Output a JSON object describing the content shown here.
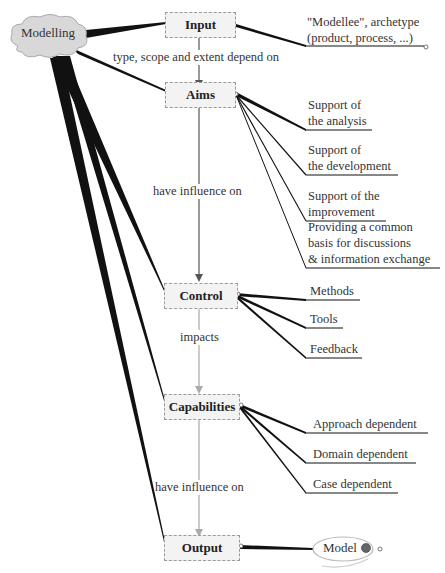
{
  "root": {
    "label": "Modelling",
    "shape": "cloud"
  },
  "nodes": [
    {
      "id": "input",
      "label": "Input"
    },
    {
      "id": "aims",
      "label": "Aims"
    },
    {
      "id": "control",
      "label": "Control"
    },
    {
      "id": "capabilities",
      "label": "Capabilities"
    },
    {
      "id": "output",
      "label": "Output"
    }
  ],
  "relations": {
    "input_to_aims": "type, scope and extent depend on",
    "aims_to_control": "have influence on",
    "control_to_capabilities": "impacts",
    "capabilities_to_output": "have influence on"
  },
  "input_leaves": [
    {
      "line1": "\"Modellee\", archetype",
      "line2": "(product, process, ...)"
    }
  ],
  "aims_leaves": [
    {
      "line1": "Support of",
      "line2": "the analysis"
    },
    {
      "line1": "Support of",
      "line2": "the development"
    },
    {
      "line1": "Support of the",
      "line2": "improvement"
    },
    {
      "line1": "Providing a common",
      "line2": "basis for discussions",
      "line3": "& information exchange"
    }
  ],
  "control_leaves": [
    "Methods",
    "Tools",
    "Feedback"
  ],
  "capabilities_leaves": [
    "Approach dependent",
    "Domain dependent",
    "Case dependent"
  ],
  "output_leaves": [
    {
      "label": "Model",
      "icon": "globe-icon"
    }
  ]
}
